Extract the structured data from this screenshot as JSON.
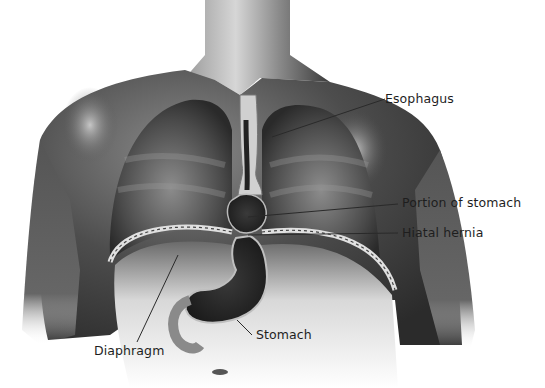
{
  "figure": {
    "colors": {
      "background": "#ffffff",
      "skin_dark": "#2e2e2e",
      "skin_mid": "#6e6e6e",
      "skin_light": "#bdbdbd",
      "leader_line": "#2a2a2a",
      "label_text": "#1e1e1e"
    },
    "labels": [
      {
        "id": "esophagus",
        "text": "Esophagus",
        "x": 385,
        "y": 93,
        "line": [
          [
            385,
            99
          ],
          [
            272,
            137
          ]
        ]
      },
      {
        "id": "portion-of-stomach",
        "text": "Portion of stomach",
        "x": 402,
        "y": 197,
        "line": [
          [
            398,
            204
          ],
          [
            248,
            217
          ]
        ]
      },
      {
        "id": "hiatal-hernia",
        "text": "Hiatal hernia",
        "x": 402,
        "y": 227,
        "line": [
          [
            398,
            233
          ],
          [
            248,
            235
          ]
        ]
      },
      {
        "id": "stomach",
        "text": "Stomach",
        "x": 256,
        "y": 329,
        "line": [
          [
            252,
            335
          ],
          [
            237,
            320
          ]
        ]
      },
      {
        "id": "diaphragm",
        "text": "Diaphragm",
        "x": 94,
        "y": 345,
        "line": [
          [
            137,
            342
          ],
          [
            178,
            255
          ]
        ]
      }
    ]
  }
}
